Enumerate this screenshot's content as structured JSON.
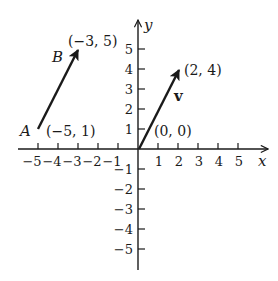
{
  "diagram": {
    "type": "coordinate-plane-vectors",
    "axes": {
      "x_label": "x",
      "y_label": "y",
      "x_range": [
        -5,
        5
      ],
      "y_range": [
        -5,
        5
      ],
      "x_ticks": [
        "−5",
        "−4",
        "−3",
        "−2",
        "−1",
        "1",
        "2",
        "3",
        "4",
        "5"
      ],
      "y_ticks_positive": [
        "1",
        "2",
        "3",
        "4",
        "5"
      ],
      "y_ticks_negative": [
        "−1",
        "−2",
        "−3",
        "−4",
        "−5"
      ]
    },
    "vectors": [
      {
        "name": "AB",
        "tail": {
          "label": "A",
          "coords": "(−5, 1)",
          "x": -5,
          "y": 1
        },
        "head": {
          "label": "B",
          "coords": "(−3, 5)",
          "x": -3,
          "y": 5
        }
      },
      {
        "name": "v",
        "label": "v",
        "tail": {
          "coords": "(0, 0)",
          "x": 0,
          "y": 0
        },
        "head": {
          "coords": "(2, 4)",
          "x": 2,
          "y": 4
        }
      }
    ],
    "colors": {
      "ink": "#1a1a1a",
      "background": "#ffffff"
    }
  }
}
